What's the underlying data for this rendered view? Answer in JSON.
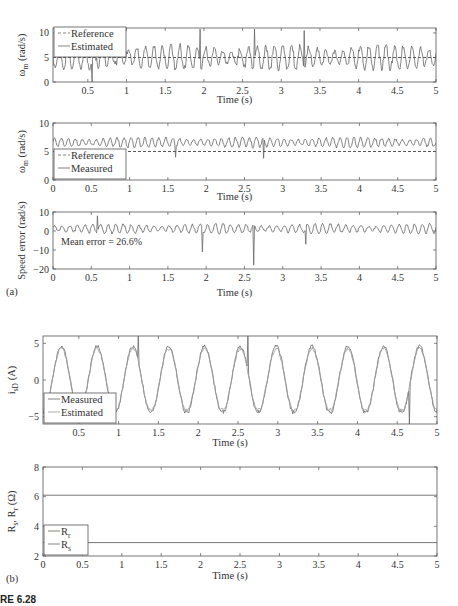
{
  "figure": {
    "caption": "RE 6.28",
    "panel_labels": [
      "(a)",
      "(b)"
    ]
  },
  "chart_data": [
    {
      "type": "line",
      "panel": "a-1",
      "title": "",
      "xlabel": "Time (s)",
      "ylabel": "ωm (rad/s)",
      "ylabel_main": "ω",
      "ylabel_sub": "m",
      "ylabel_tail": " (rad/s)",
      "xlim": [
        0.05,
        5
      ],
      "ylim": [
        0,
        11
      ],
      "xticks": [
        0.5,
        1,
        1.5,
        2,
        2.5,
        3,
        3.5,
        4,
        4.5,
        5
      ],
      "xtick_labels": [
        "0.5",
        "1",
        "1.5",
        "2",
        "2.5",
        "3",
        "3.5",
        "4",
        "4.5",
        "5"
      ],
      "yticks": [
        0,
        5,
        10
      ],
      "ytick_labels": [
        "0",
        "5",
        "10"
      ],
      "grid": false,
      "legend_position": "upper left",
      "series": [
        {
          "name": "Reference",
          "style": "dashed",
          "kind": "constant",
          "value": 5
        },
        {
          "name": "Estimated",
          "style": "solid",
          "kind": "oscillating",
          "mean": 5,
          "amplitude": 2.5,
          "freq": 9,
          "seed": 1,
          "spikes": [
            [
              0.55,
              0
            ],
            [
              1.95,
              10.8
            ],
            [
              2.65,
              10.8
            ],
            [
              3.3,
              10.5
            ]
          ]
        }
      ]
    },
    {
      "type": "line",
      "panel": "a-2",
      "title": "",
      "xlabel": "Time (s)",
      "ylabel": "ωm (rad/s)",
      "ylabel_main": "ω",
      "ylabel_sub": "m",
      "ylabel_tail": " (rad/s)",
      "xlim": [
        0,
        5
      ],
      "ylim": [
        0,
        10
      ],
      "xticks": [
        0,
        0.5,
        1,
        1.5,
        2,
        2.5,
        3,
        3.5,
        4,
        4.5,
        5
      ],
      "xtick_labels": [
        "0",
        "0.5",
        "1",
        "1.5",
        "2",
        "2.5",
        "3",
        "3.5",
        "4",
        "4.5",
        "5"
      ],
      "yticks": [
        0,
        5,
        10
      ],
      "ytick_labels": [
        "0",
        "5",
        "10"
      ],
      "grid": false,
      "legend_position": "lower left",
      "series": [
        {
          "name": "Reference",
          "style": "dashed",
          "kind": "constant",
          "value": 5
        },
        {
          "name": "Measured",
          "style": "solid",
          "kind": "oscillating",
          "mean": 6.6,
          "amplitude": 0.9,
          "freq": 11,
          "seed": 2,
          "spikes": [
            [
              1.6,
              4.0
            ],
            [
              2.75,
              3.8
            ]
          ]
        }
      ]
    },
    {
      "type": "line",
      "panel": "a-3",
      "title": "",
      "xlabel": "Time (s)",
      "ylabel": "Speed error (rad/s)",
      "xlim": [
        0,
        5
      ],
      "ylim": [
        -20,
        10
      ],
      "xticks": [
        0,
        0.5,
        1,
        1.5,
        2,
        2.5,
        3,
        3.5,
        4,
        4.5,
        5
      ],
      "xtick_labels": [
        "0",
        "0.5",
        "1",
        "1.5",
        "2",
        "2.5",
        "3",
        "3.5",
        "4",
        "4.5",
        "5"
      ],
      "yticks": [
        -20,
        -10,
        0,
        10
      ],
      "ytick_labels": [
        "−20",
        "−10",
        "0",
        "10"
      ],
      "grid": false,
      "annotation": "Mean error = 26.6%",
      "series": [
        {
          "name": "Speed error",
          "style": "solid",
          "kind": "oscillating",
          "mean": 1.2,
          "amplitude": 2.5,
          "freq": 10,
          "seed": 3,
          "spikes": [
            [
              0.58,
              8
            ],
            [
              1.95,
              -11
            ],
            [
              2.62,
              -18
            ],
            [
              3.3,
              -7
            ]
          ]
        }
      ]
    },
    {
      "type": "line",
      "panel": "b-1",
      "title": "",
      "xlabel": "Time (s)",
      "ylabel": "isD (A)",
      "ylabel_main": "i",
      "ylabel_sub": "sD",
      "ylabel_tail": " (A)",
      "xlim": [
        0.05,
        5
      ],
      "ylim": [
        -6,
        6
      ],
      "xticks": [
        0.5,
        1,
        1.5,
        2,
        2.5,
        3,
        3.5,
        4,
        4.5,
        5
      ],
      "xtick_labels": [
        "0.5",
        "1",
        "1.5",
        "2",
        "2.5",
        "3",
        "3.5",
        "4",
        "4.5",
        "5"
      ],
      "yticks": [
        -5,
        0,
        5
      ],
      "ytick_labels": [
        "−5",
        "0",
        "5"
      ],
      "grid": false,
      "legend_position": "lower left",
      "series": [
        {
          "name": "Measured",
          "style": "solid",
          "kind": "sine",
          "amplitude": 4.6,
          "period": 0.45,
          "phase_peak": 0.28,
          "seed": 4,
          "spikes": [
            [
              1.25,
              6
            ],
            [
              2.62,
              6
            ],
            [
              4.65,
              -6
            ]
          ]
        },
        {
          "name": "Estimated",
          "style": "solid-light",
          "kind": "sine",
          "amplitude": 4.3,
          "period": 0.45,
          "phase_peak": 0.28,
          "seed": 5
        }
      ]
    },
    {
      "type": "line",
      "panel": "b-2",
      "title": "",
      "xlabel": "Time (s)",
      "ylabel": "Rs, Rr (Ω)",
      "ylabel_main": "R",
      "ylabel_sub": "s",
      "ylabel_mid": ", R",
      "ylabel_sub2": "r",
      "ylabel_tail": " (Ω)",
      "xlim": [
        0,
        5
      ],
      "ylim": [
        2,
        8
      ],
      "xticks": [
        0,
        0.5,
        1,
        1.5,
        2,
        2.5,
        3,
        3.5,
        4,
        4.5,
        5
      ],
      "xtick_labels": [
        "0",
        "0.5",
        "1",
        "1.5",
        "2",
        "2.5",
        "3",
        "3.5",
        "4",
        "4.5",
        "5"
      ],
      "yticks": [
        2,
        4,
        6,
        8
      ],
      "ytick_labels": [
        "2",
        "4",
        "6",
        "8"
      ],
      "grid": false,
      "legend_position": "lower left",
      "series": [
        {
          "name": "Rr",
          "name_main": "R",
          "name_sub": "r",
          "style": "solid",
          "kind": "constant",
          "value": 6.1
        },
        {
          "name": "Rs",
          "name_main": "R",
          "name_sub": "s",
          "style": "solid",
          "kind": "constant",
          "value": 2.9
        }
      ]
    }
  ],
  "layout": {
    "panels": [
      {
        "x0": 53,
        "x1": 436,
        "y0": 28,
        "y1": 82,
        "xlabel_y": 103
      },
      {
        "x0": 53,
        "x1": 436,
        "y0": 123,
        "y1": 180,
        "xlabel_y": 200
      },
      {
        "x0": 53,
        "x1": 436,
        "y0": 212,
        "y1": 269,
        "xlabel_y": 296
      },
      {
        "x0": 43,
        "x1": 437,
        "y0": 336,
        "y1": 424,
        "xlabel_y": 446
      },
      {
        "x0": 43,
        "x1": 437,
        "y0": 467,
        "y1": 556,
        "xlabel_y": 579
      }
    ],
    "panel_label_pos": [
      [
        6,
        295
      ],
      [
        6,
        582
      ]
    ],
    "caption_pos": [
      0,
      603
    ],
    "colors": {
      "axis": "#555555",
      "line": "#666666",
      "light_line": "#9a9a9a"
    }
  }
}
